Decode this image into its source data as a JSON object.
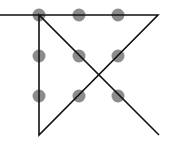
{
  "diagram": {
    "title": "",
    "colors": {
      "background": "#ffffff",
      "dot": "#8c8c8c",
      "line": "#111111"
    },
    "dot_radius": 6.5,
    "line_width": 1.6,
    "dots": [
      {
        "x": 39,
        "y": 15
      },
      {
        "x": 79,
        "y": 15
      },
      {
        "x": 118,
        "y": 15
      },
      {
        "x": 39,
        "y": 56
      },
      {
        "x": 79,
        "y": 56
      },
      {
        "x": 118,
        "y": 56
      },
      {
        "x": 39,
        "y": 96
      },
      {
        "x": 79,
        "y": 96
      },
      {
        "x": 118,
        "y": 96
      }
    ],
    "path": [
      {
        "x": 0,
        "y": 15
      },
      {
        "x": 158,
        "y": 15
      },
      {
        "x": 39,
        "y": 135
      },
      {
        "x": 39,
        "y": 15
      },
      {
        "x": 159,
        "y": 135
      }
    ]
  }
}
